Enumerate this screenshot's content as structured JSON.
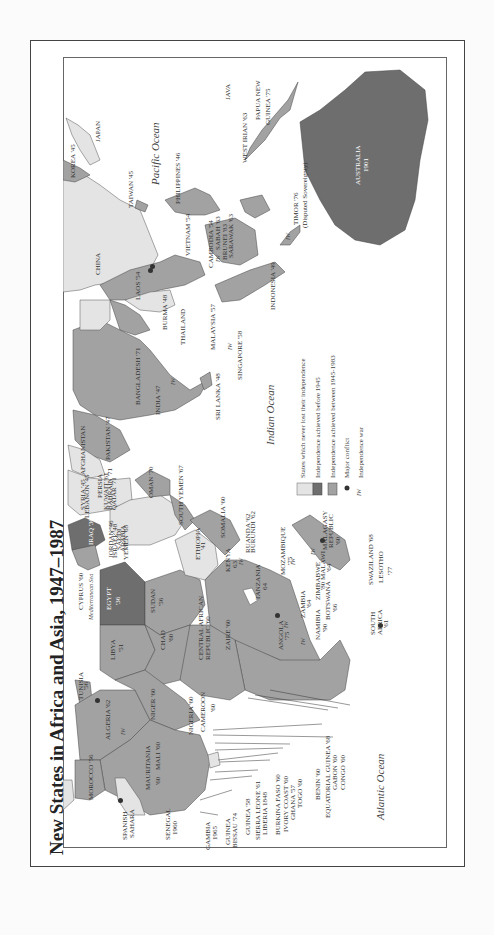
{
  "title": "New States in Africa and Asia, 1947–1987",
  "colors": {
    "never_lost": "#e4e4e4",
    "before_1945": "#6e6e6e",
    "between_1945_1983": "#a2a2a2",
    "ocean": "#ffffff",
    "border": "#444444"
  },
  "legend": {
    "items": [
      {
        "symbol": "swatch-light",
        "label": "States which never lost their independence"
      },
      {
        "symbol": "swatch-dark",
        "label": "Independence achieved before 1945"
      },
      {
        "symbol": "swatch-medium",
        "label": "Independence achieved between 1945-1983"
      },
      {
        "symbol": "conflict-icon",
        "label": "Major conflict"
      },
      {
        "symbol": "IW",
        "label": "Independence war"
      }
    ]
  },
  "oceans": {
    "pacific": "Pacific Ocean",
    "indian": "Indian Ocean",
    "atlantic": "Atlantic Ocean",
    "mediterranean": "Mediterranean Sea"
  },
  "labels": {
    "korea": "KOREA '45",
    "japan": "JAPAN",
    "taiwan": "TAIWAN '45",
    "china": "CHINA",
    "philippines": "PHILIPPINES '46",
    "java": "JAVA",
    "west_irian": "WEST IRIAN '63",
    "png": "PAPUA NEW",
    "png2": "GUINEA '75",
    "australia": "AUSTRALIA",
    "australia_year": "1901",
    "timor": "TIMOR '76",
    "timor_note": "(Disputed Sovereignty)",
    "vietnam": "VIETNAM '54",
    "cambodia": "CAMBODIA '54",
    "brunei": "BRUNEI '83",
    "sabah": "SABAH '63",
    "sarawak": "SARAWAK '63",
    "laos": "LAOS '54",
    "indonesia": "INDONESIA '49",
    "burma": "BURMA '48",
    "thailand": "THAILAND",
    "malaysia": "MALAYSIA '57",
    "singapore": "SINGAPORE '58",
    "sri_lanka": "SRI LANKA '48",
    "bangladesh": "BANGLADESH '71",
    "india": "INDIA '47",
    "pakistan": "PAKISTAN '47",
    "afghanistan": "AFGHANISTAN",
    "persia": "PERSIA",
    "syria": "SYRIA '45",
    "lebanon": "LEBANON '45",
    "kuwait": "KUWAIT '61",
    "bahrain": "BAHRAIN '71",
    "qatar": "QATAR '71",
    "oman": "OMAN '70",
    "south_yemen": "SOUTH YEMEN '67",
    "iraq": "IRAQ '30",
    "jordan": "JORDAN '46",
    "israel": "ISRAEL '48",
    "saudi": "SAUDI",
    "arabia": "ARABIA",
    "yemen": "YEMEN '68",
    "cyprus": "CYPRUS '60",
    "egypt": "EGYPT",
    "egypt_year": "'36",
    "sudan": "SUDAN",
    "sudan_year": "'56",
    "ethiopia": "ETHIOPIA",
    "ethiopia_year": "'41",
    "somalia": "SOMALIA '60",
    "ruanda": "RUANDA '62",
    "burundi": "BURUNDI '62",
    "kenya": "KENYA",
    "kenya_year": "63",
    "tanzania": "TANZANIA",
    "tanzania_year": "64",
    "mozambique": "MOZAMBIQUE",
    "mozambique_year": "'75",
    "malagasy": "MALAGASY",
    "malagasy2": "REPUBLIC",
    "malagasy_year": "'60",
    "malawi": "MALAWI",
    "malawi_year": "'64",
    "swaziland": "SWAZILAND '68",
    "lesotho": "LESOTHO",
    "lesotho_year": "'77",
    "zimbabwe": "ZIMBABWE",
    "zimbabwe_year": "'80",
    "zambia": "ZAMBIA",
    "zambia_year": "'64",
    "botswana": "BOTSWANA",
    "botswana_year": "'66",
    "namibia": "NAMIBIA",
    "namibia_year": "'90",
    "south_africa": "SOUTH",
    "south_africa2": "AFRICA",
    "south_africa_year": "'61",
    "angola": "ANGOLA",
    "angola_year": "'75",
    "zaire": "ZAIRE '60",
    "car": "CENTRAL AFRICAN",
    "car2": "REPUBLIC '60",
    "chad": "CHAD",
    "chad_year": "'60",
    "libya": "LIBYA",
    "libya_year": "'51",
    "tunisia": "TUNISIA",
    "tunisia_year": "'56",
    "algeria": "ALGERIA '62",
    "niger": "NIGER '60",
    "nigeria": "NIGERIA '60",
    "cameroon": "CAMEROON",
    "cameroon_year": "'60",
    "mali": "MALI '60",
    "morocco": "MOROCCO '56",
    "mauritania": "MAURITANIA",
    "mauritania_year": "'60",
    "spanish_sahara": "SPANISH",
    "spanish_sahara2": "SAHARA",
    "senegal": "SENEGAL",
    "senegal_year": "1960",
    "gambia": "GAMBIA",
    "gambia_year": "1965",
    "guinea_bissau": "GUINEA",
    "guinea_bissau2": "BISSAU '74",
    "guinea": "GUINEA '58",
    "sierra_leone": "SIERRA LEONE '61",
    "liberia": "LIBERIA 1848",
    "burkina": "BURKINA FASO '60",
    "ivory_coast": "IVORY COAST '60",
    "ghana": "GHANA '57",
    "togo": "TOGO '60",
    "benin": "BENIN '60",
    "eq_guinea": "EQUATORIAL GUINEA '68",
    "gabon": "GABON '60",
    "congo": "CONGO '60",
    "iw": "IW"
  }
}
